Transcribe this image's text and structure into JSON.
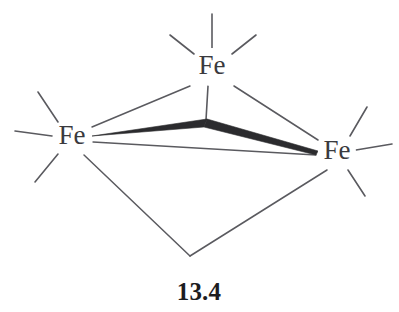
{
  "figure": {
    "kind": "chemical-structure-diagram",
    "caption": "13.4",
    "background_color": "#ffffff",
    "bond_color": "#5a5a5f",
    "wedge_color": "#2b2b2e",
    "label_color": "#3a3a3e",
    "caption_color": "#1d1d1f"
  },
  "atoms": [
    {
      "id": "fe-top",
      "label": "Fe",
      "x": 212,
      "y": 67,
      "element": "Fe"
    },
    {
      "id": "fe-left",
      "label": "Fe",
      "x": 72,
      "y": 137,
      "element": "Fe"
    },
    {
      "id": "fe-right",
      "label": "Fe",
      "x": 337,
      "y": 152,
      "element": "Fe"
    }
  ],
  "vertices": [
    {
      "id": "apex",
      "x": 205,
      "y": 121
    },
    {
      "id": "bottom",
      "x": 190,
      "y": 256
    }
  ],
  "bonds": {
    "framework": [
      {
        "from": "fe-top",
        "to": "fe-left",
        "style": "line"
      },
      {
        "from": "fe-top",
        "to": "fe-right",
        "style": "line"
      },
      {
        "from": "fe-left",
        "to": "bottom",
        "style": "line"
      },
      {
        "from": "fe-right",
        "to": "bottom",
        "style": "line"
      },
      {
        "from": "fe-left",
        "to": "fe-right",
        "style": "line"
      }
    ],
    "wedge": [
      {
        "from": "fe-left",
        "to": "apex",
        "style": "solid-wedge"
      },
      {
        "from": "apex",
        "to": "fe-right",
        "style": "solid-wedge"
      }
    ],
    "stub_vertical": [
      {
        "from": "fe-top",
        "to": "apex",
        "style": "line"
      }
    ]
  },
  "ligand_stubs": {
    "fe-top": [
      "up",
      "upper-left",
      "upper-right"
    ],
    "fe-left": [
      "upper-left",
      "left",
      "lower-left"
    ],
    "fe-right": [
      "upper-right",
      "right",
      "lower-right"
    ]
  },
  "counts": {
    "metal_atoms": 3,
    "caption_number": "13.4"
  }
}
